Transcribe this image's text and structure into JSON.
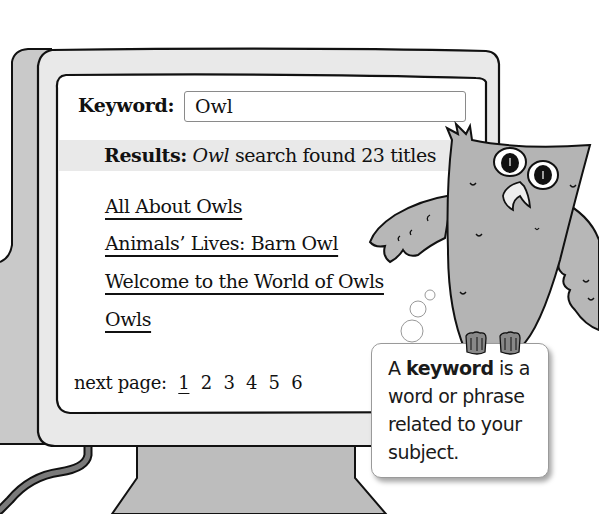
{
  "search": {
    "keyword_label": "Keyword:",
    "keyword_value": "Owl"
  },
  "results": {
    "label": "Results:",
    "query": "Owl",
    "summary": "search found 23 titles",
    "count": 23
  },
  "result_links": [
    {
      "title": "All About Owls"
    },
    {
      "title": "Animals’ Lives: Barn Owl"
    },
    {
      "title": "Welcome to the World of Owls"
    },
    {
      "title": "Owls"
    }
  ],
  "pagination": {
    "label": "next page:",
    "pages": [
      "1",
      "2",
      "3",
      "4",
      "5",
      "6"
    ],
    "current": "1"
  },
  "callout": {
    "prefix": "A",
    "term": "keyword",
    "definition": "is a word or phrase related to your subject."
  },
  "colors": {
    "bezel": "#e8e8e8",
    "bezel_side": "#c8c8c8",
    "stand": "#b9b9b9",
    "owl": "#b4b4b4",
    "results_band": "#e9e9e9",
    "outline": "#111111"
  }
}
